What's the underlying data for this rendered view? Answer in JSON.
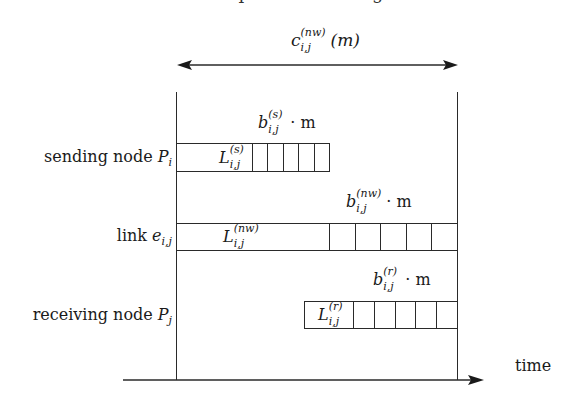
{
  "figure": {
    "top_cutoff_text": "···· p ······· ········ g",
    "total_cost": {
      "symbol": "c",
      "sub": "i,j",
      "sup": "(nw)",
      "arg": "(m)"
    },
    "time_axis_label": "time",
    "rows": [
      {
        "label_text": "sending node ",
        "label_symbol": "P",
        "label_sub": "i",
        "latency": {
          "symbol": "L",
          "sub": "i,j",
          "sup": "(s)"
        },
        "bandwidth": {
          "symbol": "b",
          "sub": "i,j",
          "sup": "(s)",
          "suffix": "· m"
        },
        "cells": 5
      },
      {
        "label_text": "link ",
        "label_symbol": "e",
        "label_sub": "i,j",
        "latency": {
          "symbol": "L",
          "sub": "i,j",
          "sup": "(nw)"
        },
        "bandwidth": {
          "symbol": "b",
          "sub": "i,j",
          "sup": "(nw)",
          "suffix": "· m"
        },
        "cells": 5
      },
      {
        "label_text": "receiving node ",
        "label_symbol": "P",
        "label_sub": "j",
        "latency": {
          "symbol": "L",
          "sub": "i,j",
          "sup": "(r)"
        },
        "bandwidth": {
          "symbol": "b",
          "sub": "i,j",
          "sup": "(r)",
          "suffix": "· m"
        },
        "cells": 5
      }
    ],
    "colors": {
      "ink": "#1a1a1a",
      "background": "#ffffff"
    }
  }
}
